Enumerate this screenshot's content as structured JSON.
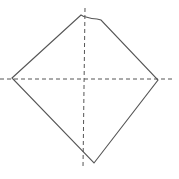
{
  "diagram": {
    "width": 179,
    "height": 179,
    "background": "#ffffff",
    "stroke_color": "#555555",
    "axis_color": "#555555",
    "shape": {
      "type": "quadrilateral",
      "vertices": {
        "left": [
          12,
          78
        ],
        "top": [
          81,
          16
        ],
        "top_notch_end": [
          101,
          20
        ],
        "right": [
          158,
          80
        ],
        "bottom": [
          94,
          163
        ]
      },
      "path": "M12,78 L81,15 Q84,17 86,17 Q92,19 97,19 L101,20 L158,80 L94,163 Z"
    },
    "axes": {
      "vertical": {
        "x": 85,
        "y1": 8,
        "y2": 168,
        "dash": "4,3"
      },
      "horizontal": {
        "y": 79,
        "x1": 0,
        "x2": 172,
        "dash": "4,3"
      }
    }
  }
}
